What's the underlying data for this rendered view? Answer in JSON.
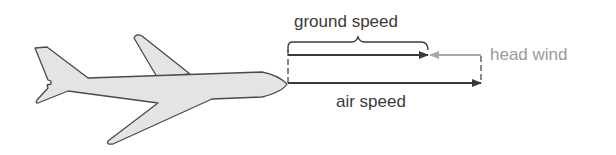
{
  "diagram": {
    "title": "",
    "labels": {
      "ground_speed": "ground speed",
      "head_wind": "head wind",
      "air_speed": "air speed"
    },
    "elements": {
      "airplane": {
        "icon": "airplane-icon",
        "fill": "#e4e4e4",
        "stroke": "#4a4a4a"
      },
      "ground_speed_arrow": {
        "from_x": 288,
        "to_x": 428,
        "y": 55,
        "color": "#3a3a3a"
      },
      "head_wind_arrow": {
        "from_x": 481,
        "to_x": 430,
        "y": 55,
        "color": "#a8a8a8"
      },
      "air_speed_arrow": {
        "from_x": 288,
        "to_x": 481,
        "y": 83,
        "color": "#3a3a3a"
      },
      "ground_speed_brace": {
        "from_x": 288,
        "to_x": 428,
        "y": 43
      }
    },
    "colors": {
      "primary_line": "#3a3a3a",
      "wind_line": "#a8a8a8",
      "plane_fill": "#e4e4e4"
    }
  }
}
